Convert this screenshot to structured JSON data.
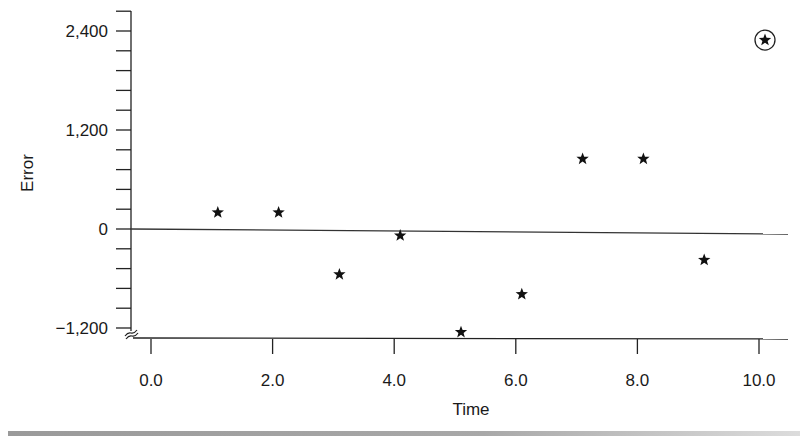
{
  "chart_data": {
    "type": "scatter",
    "title": "",
    "xlabel": "Time",
    "ylabel": "Error",
    "xlim": [
      0.0,
      10.0
    ],
    "ylim": [
      -1200,
      2640
    ],
    "x_ticks": [
      "0.0",
      "2.0",
      "4.0",
      "6.0",
      "8.0",
      "10.0"
    ],
    "y_ticks": [
      "2,400",
      "1,200",
      "0",
      "−1,200"
    ],
    "y_minor_tick_step": 240,
    "grid": false,
    "legend": null,
    "zero_line": true,
    "axis_break": "y-axis broken below −1,200",
    "marker": "star",
    "series": [
      {
        "name": "Error",
        "points": [
          {
            "x": 1.0,
            "y": 200
          },
          {
            "x": 2.0,
            "y": 200
          },
          {
            "x": 3.0,
            "y": -550
          },
          {
            "x": 4.0,
            "y": -80
          },
          {
            "x": 5.0,
            "y": -1250
          },
          {
            "x": 6.0,
            "y": -790
          },
          {
            "x": 7.0,
            "y": 850
          },
          {
            "x": 8.0,
            "y": 850
          },
          {
            "x": 9.0,
            "y": -375
          },
          {
            "x": 10.0,
            "y": 2290,
            "circled": true
          }
        ]
      }
    ],
    "annotations": [
      "Point at x=10.0 circled (outlier)"
    ]
  }
}
